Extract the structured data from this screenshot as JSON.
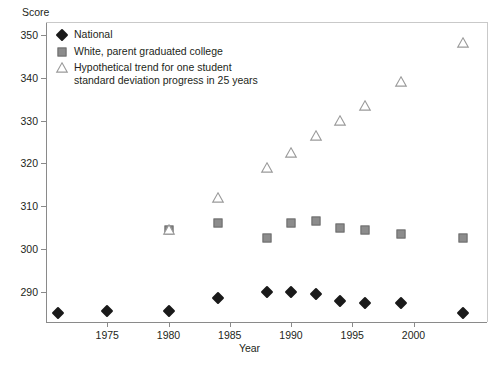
{
  "chart_data": {
    "type": "scatter",
    "title": "",
    "xlabel": "Year",
    "ylabel": "Score",
    "xlim": [
      1970,
      2006
    ],
    "ylim": [
      283,
      353
    ],
    "xticks": [
      1975,
      1980,
      1985,
      1990,
      1995,
      2000
    ],
    "yticks": [
      290,
      300,
      310,
      320,
      330,
      340,
      350
    ],
    "grid": false,
    "legend_position": "top-left",
    "series": [
      {
        "name": "National",
        "marker": "filled-diamond",
        "color": "#1a1a1a",
        "points": [
          {
            "x": 1971,
            "y": 285
          },
          {
            "x": 1975,
            "y": 285.5
          },
          {
            "x": 1980,
            "y": 285.5
          },
          {
            "x": 1984,
            "y": 288.5
          },
          {
            "x": 1988,
            "y": 290
          },
          {
            "x": 1990,
            "y": 290
          },
          {
            "x": 1992,
            "y": 289.5
          },
          {
            "x": 1994,
            "y": 288
          },
          {
            "x": 1996,
            "y": 287.5
          },
          {
            "x": 1999,
            "y": 287.5
          },
          {
            "x": 2004,
            "y": 285
          }
        ]
      },
      {
        "name": "White, parent graduated college",
        "marker": "filled-square",
        "color": "#8c8c8c",
        "points": [
          {
            "x": 1980,
            "y": 304.5
          },
          {
            "x": 1984,
            "y": 306
          },
          {
            "x": 1988,
            "y": 302.5
          },
          {
            "x": 1990,
            "y": 306
          },
          {
            "x": 1992,
            "y": 306.5
          },
          {
            "x": 1994,
            "y": 305
          },
          {
            "x": 1996,
            "y": 304.5
          },
          {
            "x": 1999,
            "y": 303.5
          },
          {
            "x": 2004,
            "y": 302.5
          }
        ]
      },
      {
        "name": "Hypothetical trend for one student\nstandard deviation progress in 25 years",
        "marker": "open-triangle",
        "color": "#9a9a9a",
        "points": [
          {
            "x": 1980,
            "y": 304.5
          },
          {
            "x": 1984,
            "y": 312
          },
          {
            "x": 1988,
            "y": 319
          },
          {
            "x": 1990,
            "y": 322.5
          },
          {
            "x": 1992,
            "y": 326.5
          },
          {
            "x": 1994,
            "y": 330
          },
          {
            "x": 1996,
            "y": 333.5
          },
          {
            "x": 1999,
            "y": 339
          },
          {
            "x": 2004,
            "y": 348
          }
        ]
      }
    ]
  },
  "legend": {
    "items": [
      {
        "label": "National",
        "marker": "filled-diamond"
      },
      {
        "label": "White, parent graduated college",
        "marker": "filled-square"
      },
      {
        "label": "Hypothetical trend for one student\nstandard deviation progress in 25 years",
        "marker": "open-triangle"
      }
    ]
  }
}
